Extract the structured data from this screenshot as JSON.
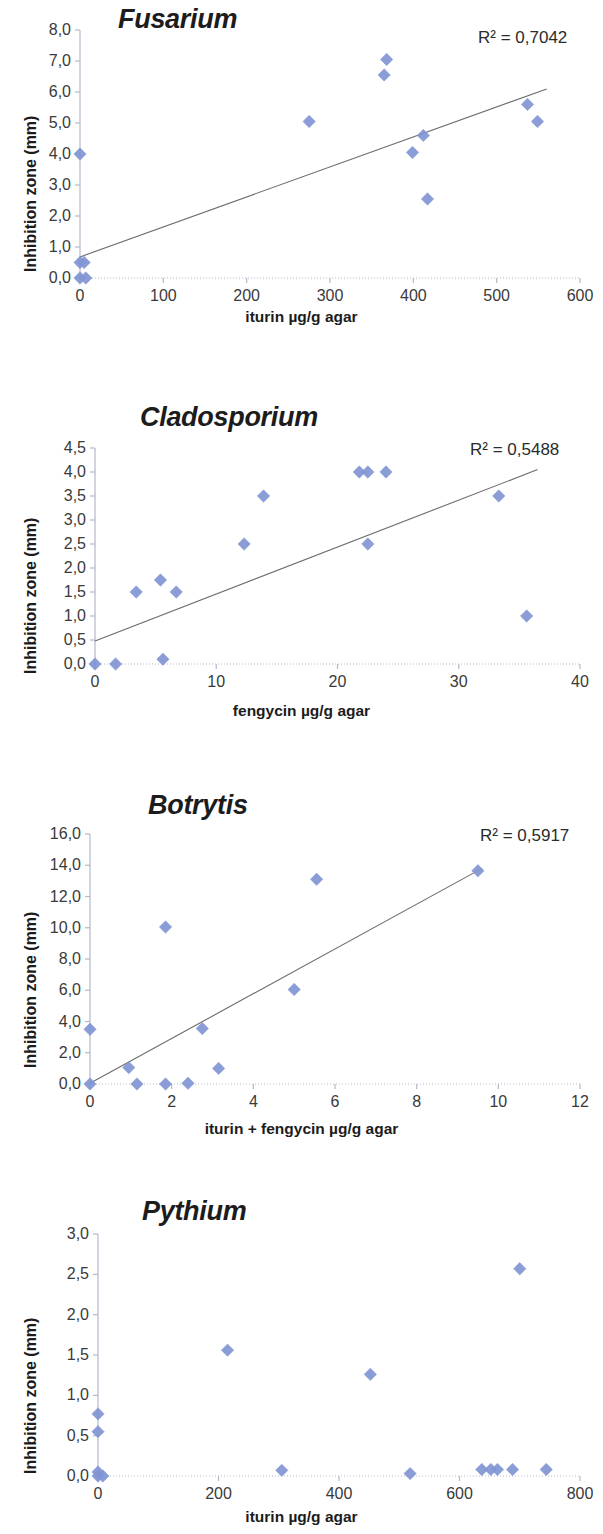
{
  "figure": {
    "panel_count": 4,
    "marker_color": "#8195d4",
    "trendline_color": "#6b6b6b",
    "axis_color": "#b4b8c8",
    "text_color": "#2b2b2b"
  },
  "charts": [
    {
      "id": "fusarium",
      "type": "scatter",
      "title": "Fusarium",
      "r2_label": "R² = 0,7042",
      "xlabel": "iturin µg/g agar",
      "ylabel": "Inhibition zone (mm)",
      "xlim": [
        0,
        600
      ],
      "ylim": [
        0,
        8
      ],
      "xticks": [
        "0",
        "100",
        "200",
        "300",
        "400",
        "500",
        "600"
      ],
      "xtick_values": [
        0,
        100,
        200,
        300,
        400,
        500,
        600
      ],
      "yticks": [
        "0,0",
        "1,0",
        "2,0",
        "3,0",
        "4,0",
        "5,0",
        "6,0",
        "7,0",
        "8,0"
      ],
      "ytick_values": [
        0,
        1,
        2,
        3,
        4,
        5,
        6,
        7,
        8
      ],
      "grid": false,
      "legend": "none",
      "trendline": {
        "x0": 0,
        "y0": 0.68,
        "x1": 560,
        "y1": 6.1
      },
      "points": [
        {
          "x": 0,
          "y": 4.0
        },
        {
          "x": 0,
          "y": 0.5
        },
        {
          "x": 5,
          "y": 0.5
        },
        {
          "x": 0,
          "y": 0.0
        },
        {
          "x": 7,
          "y": 0.0
        },
        {
          "x": 275,
          "y": 5.05
        },
        {
          "x": 368,
          "y": 7.05
        },
        {
          "x": 365,
          "y": 6.55
        },
        {
          "x": 399,
          "y": 4.05
        },
        {
          "x": 412,
          "y": 4.6
        },
        {
          "x": 417,
          "y": 2.55
        },
        {
          "x": 537,
          "y": 5.6
        },
        {
          "x": 549,
          "y": 5.05
        }
      ]
    },
    {
      "id": "cladosporium",
      "type": "scatter",
      "title": "Cladosporium",
      "r2_label": "R² = 0,5488",
      "xlabel": "fengycin µg/g agar",
      "ylabel": "Inhibition zone (mm)",
      "xlim": [
        0,
        40
      ],
      "ylim": [
        0,
        4.5
      ],
      "xticks": [
        "0",
        "10",
        "20",
        "30",
        "40"
      ],
      "xtick_values": [
        0,
        10,
        20,
        30,
        40
      ],
      "yticks": [
        "0,0",
        "0,5",
        "1,0",
        "1,5",
        "2,0",
        "2,5",
        "3,0",
        "3,5",
        "4,0",
        "4,5"
      ],
      "ytick_values": [
        0,
        0.5,
        1,
        1.5,
        2,
        2.5,
        3,
        3.5,
        4,
        4.5
      ],
      "grid": false,
      "legend": "none",
      "trendline": {
        "x0": 0,
        "y0": 0.48,
        "x1": 36.5,
        "y1": 4.05
      },
      "points": [
        {
          "x": 0.0,
          "y": 0.0
        },
        {
          "x": 1.7,
          "y": 0.0
        },
        {
          "x": 5.6,
          "y": 0.1
        },
        {
          "x": 3.4,
          "y": 1.5
        },
        {
          "x": 5.4,
          "y": 1.75
        },
        {
          "x": 6.7,
          "y": 1.5
        },
        {
          "x": 12.3,
          "y": 2.5
        },
        {
          "x": 13.9,
          "y": 3.5
        },
        {
          "x": 21.8,
          "y": 4.0
        },
        {
          "x": 22.5,
          "y": 4.0
        },
        {
          "x": 24.0,
          "y": 4.0
        },
        {
          "x": 22.5,
          "y": 2.5
        },
        {
          "x": 33.3,
          "y": 3.5
        },
        {
          "x": 35.6,
          "y": 1.0
        }
      ]
    },
    {
      "id": "botrytis",
      "type": "scatter",
      "title": "Botrytis",
      "r2_label": "R² = 0,5917",
      "xlabel": "iturin + fengycin µg/g agar",
      "ylabel": "Inhibition zone (mm)",
      "xlim": [
        0,
        12
      ],
      "ylim": [
        0,
        16
      ],
      "xticks": [
        "0",
        "2",
        "4",
        "6",
        "8",
        "10",
        "12"
      ],
      "xtick_values": [
        0,
        2,
        4,
        6,
        8,
        10,
        12
      ],
      "yticks": [
        "0,0",
        "2,0",
        "4,0",
        "6,0",
        "8,0",
        "10,0",
        "12,0",
        "14,0",
        "16,0"
      ],
      "ytick_values": [
        0,
        2,
        4,
        6,
        8,
        10,
        12,
        14,
        16
      ],
      "grid": false,
      "legend": "none",
      "trendline": {
        "x0": 0,
        "y0": 0.05,
        "x1": 9.6,
        "y1": 13.8
      },
      "points": [
        {
          "x": 0.0,
          "y": 3.5
        },
        {
          "x": 0.0,
          "y": 0.0
        },
        {
          "x": 0.95,
          "y": 1.05
        },
        {
          "x": 1.15,
          "y": 0.0
        },
        {
          "x": 1.85,
          "y": 10.05
        },
        {
          "x": 1.85,
          "y": 0.0
        },
        {
          "x": 2.4,
          "y": 0.05
        },
        {
          "x": 2.75,
          "y": 3.55
        },
        {
          "x": 3.15,
          "y": 1.0
        },
        {
          "x": 5.0,
          "y": 6.05
        },
        {
          "x": 5.55,
          "y": 13.1
        },
        {
          "x": 9.5,
          "y": 13.65
        }
      ]
    },
    {
      "id": "pythium",
      "type": "scatter",
      "title": "Pythium",
      "r2_label": "",
      "xlabel": "iturin µg/g agar",
      "ylabel": "Inhibition zone (mm)",
      "xlim": [
        0,
        800
      ],
      "ylim": [
        0,
        3.0
      ],
      "xticks": [
        "0",
        "200",
        "400",
        "600",
        "800"
      ],
      "xtick_values": [
        0,
        200,
        400,
        600,
        800
      ],
      "yticks": [
        "0,0",
        "0,5",
        "1,0",
        "1,5",
        "2,0",
        "2,5",
        "3,0"
      ],
      "ytick_values": [
        0,
        0.5,
        1,
        1.5,
        2,
        2.5,
        3
      ],
      "grid": false,
      "legend": "none",
      "trendline": null,
      "points": [
        {
          "x": 0,
          "y": 0.77
        },
        {
          "x": 0,
          "y": 0.55
        },
        {
          "x": 0,
          "y": 0.05
        },
        {
          "x": 0,
          "y": 0.0
        },
        {
          "x": 8,
          "y": 0.0
        },
        {
          "x": 215,
          "y": 1.56
        },
        {
          "x": 305,
          "y": 0.07
        },
        {
          "x": 452,
          "y": 1.26
        },
        {
          "x": 518,
          "y": 0.03
        },
        {
          "x": 637,
          "y": 0.08
        },
        {
          "x": 652,
          "y": 0.08
        },
        {
          "x": 663,
          "y": 0.08
        },
        {
          "x": 688,
          "y": 0.08
        },
        {
          "x": 700,
          "y": 2.57
        },
        {
          "x": 744,
          "y": 0.08
        }
      ]
    }
  ],
  "chart_data": [
    {
      "type": "scatter",
      "title": "Fusarium",
      "xlabel": "iturin µg/g agar",
      "ylabel": "Inhibition zone (mm)",
      "xlim": [
        0,
        600
      ],
      "ylim": [
        0,
        8
      ],
      "grid": false,
      "legend": "none",
      "annotations": [
        "R² = 0,7042"
      ],
      "x": [
        0,
        0,
        5,
        0,
        7,
        275,
        368,
        365,
        399,
        412,
        417,
        537,
        549
      ],
      "y": [
        4.0,
        0.5,
        0.5,
        0.0,
        0.0,
        5.05,
        7.05,
        6.55,
        4.05,
        4.6,
        2.55,
        5.6,
        5.05
      ],
      "trendline": {
        "x": [
          0,
          560
        ],
        "y": [
          0.68,
          6.1
        ]
      }
    },
    {
      "type": "scatter",
      "title": "Cladosporium",
      "xlabel": "fengycin µg/g agar",
      "ylabel": "Inhibition zone (mm)",
      "xlim": [
        0,
        40
      ],
      "ylim": [
        0,
        4.5
      ],
      "grid": false,
      "legend": "none",
      "annotations": [
        "R² = 0,5488"
      ],
      "x": [
        0.0,
        1.7,
        5.6,
        3.4,
        5.4,
        6.7,
        12.3,
        13.9,
        21.8,
        22.5,
        24.0,
        22.5,
        33.3,
        35.6
      ],
      "y": [
        0.0,
        0.0,
        0.1,
        1.5,
        1.75,
        1.5,
        2.5,
        3.5,
        4.0,
        4.0,
        4.0,
        2.5,
        3.5,
        1.0
      ],
      "trendline": {
        "x": [
          0,
          36.5
        ],
        "y": [
          0.48,
          4.05
        ]
      }
    },
    {
      "type": "scatter",
      "title": "Botrytis",
      "xlabel": "iturin + fengycin µg/g agar",
      "ylabel": "Inhibition zone (mm)",
      "xlim": [
        0,
        12
      ],
      "ylim": [
        0,
        16
      ],
      "grid": false,
      "legend": "none",
      "annotations": [
        "R² = 0,5917"
      ],
      "x": [
        0.0,
        0.0,
        0.95,
        1.15,
        1.85,
        1.85,
        2.4,
        2.75,
        3.15,
        5.0,
        5.55,
        9.5
      ],
      "y": [
        3.5,
        0.0,
        1.05,
        0.0,
        10.05,
        0.0,
        0.05,
        3.55,
        1.0,
        6.05,
        13.1,
        13.65
      ],
      "trendline": {
        "x": [
          0,
          9.6
        ],
        "y": [
          0.05,
          13.8
        ]
      }
    },
    {
      "type": "scatter",
      "title": "Pythium",
      "xlabel": "iturin µg/g agar",
      "ylabel": "Inhibition zone (mm)",
      "xlim": [
        0,
        800
      ],
      "ylim": [
        0,
        3.0
      ],
      "grid": false,
      "legend": "none",
      "annotations": [],
      "x": [
        0,
        0,
        0,
        0,
        8,
        215,
        305,
        452,
        518,
        637,
        652,
        663,
        688,
        700,
        744
      ],
      "y": [
        0.77,
        0.55,
        0.05,
        0.0,
        0.0,
        1.56,
        0.07,
        1.26,
        0.03,
        0.08,
        0.08,
        0.08,
        0.08,
        2.57,
        0.08
      ],
      "trendline": null
    }
  ]
}
